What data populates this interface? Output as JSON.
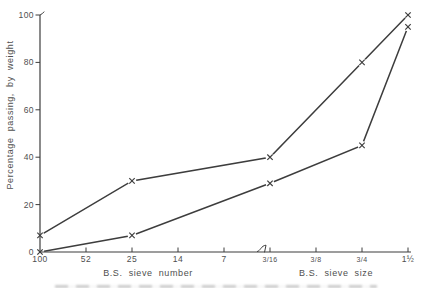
{
  "figure": {
    "background": "#ffffff",
    "line_color": "#3d3d3d",
    "text_color": "#4f4f4f"
  },
  "chart_data": {
    "type": "line",
    "title": "",
    "ylabel": "Percentage passing, by weight",
    "xlabels": {
      "left": "B.S. sieve number",
      "right": "B.S. sieve size"
    },
    "categories": [
      "100",
      "52",
      "25",
      "14",
      "7",
      "3/16",
      "3/8",
      "3/4",
      "1½"
    ],
    "x_axis_groups": [
      {
        "label": "B.S. sieve number",
        "categories": [
          "100",
          "52",
          "25",
          "14",
          "7"
        ]
      },
      {
        "label": "B.S. sieve size",
        "categories": [
          "3/16",
          "3/8",
          "3/4",
          "1½"
        ]
      }
    ],
    "y_ticks": [
      0,
      20,
      40,
      60,
      80,
      100
    ],
    "ylim": [
      0,
      100
    ],
    "grid": false,
    "legend": false,
    "marker": "x",
    "scale_break_before_category": "3/16",
    "series": [
      {
        "name": "upper curve",
        "points": [
          [
            "100",
            7
          ],
          [
            "25",
            30
          ],
          [
            "3/16",
            40
          ],
          [
            "3/4",
            80
          ],
          [
            "1½",
            100
          ]
        ]
      },
      {
        "name": "lower curve",
        "points": [
          [
            "100",
            0
          ],
          [
            "25",
            7
          ],
          [
            "3/16",
            29
          ],
          [
            "3/4",
            45
          ],
          [
            "1½",
            95
          ]
        ]
      }
    ]
  }
}
